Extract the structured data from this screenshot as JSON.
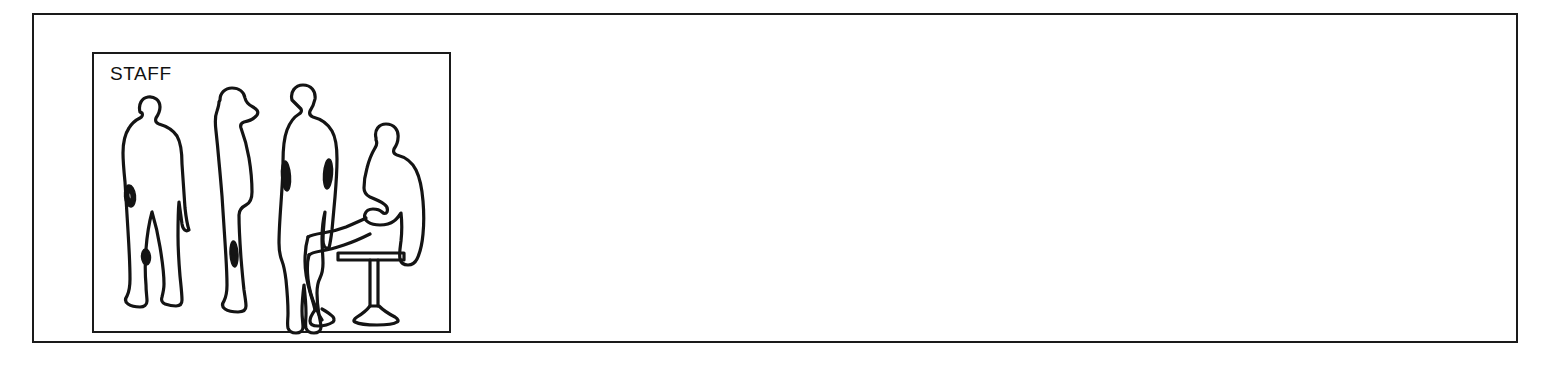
{
  "page": {
    "background_color": "#ffffff",
    "line_color": "#141414",
    "width": 1549,
    "height": 367
  },
  "outer_frame": {
    "name": "drawing-sheet-border",
    "stroke_color": "#1a1a1a",
    "stroke_width": 2
  },
  "legend_panel": {
    "title": "STAFF",
    "stroke_color": "#1a1a1a",
    "stroke_width": 2,
    "figure_count": 4,
    "figures": [
      {
        "id": "figure-1",
        "label": "standing-person-front",
        "pose": "standing",
        "orientation": "front",
        "details": [
          "hand-oval",
          "knee-oval"
        ]
      },
      {
        "id": "figure-2",
        "label": "standing-person-profile",
        "pose": "standing",
        "orientation": "profile-left",
        "details": [
          "hand-oval"
        ]
      },
      {
        "id": "figure-3",
        "label": "standing-person-coat",
        "pose": "standing",
        "orientation": "back",
        "details": [
          "left-arm-oval",
          "right-arm-oval"
        ]
      },
      {
        "id": "figure-4",
        "label": "seated-person-on-stool",
        "pose": "seated",
        "orientation": "profile-left",
        "details": [
          "hands-in-lap",
          "pedestal-stool"
        ]
      }
    ]
  },
  "empty_area": {
    "name": "blank-drawing-area",
    "content": ""
  }
}
